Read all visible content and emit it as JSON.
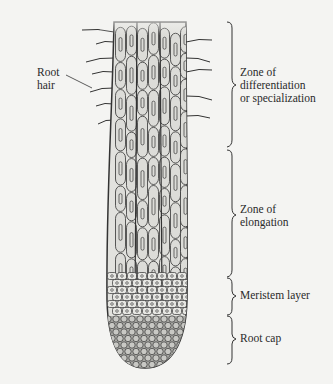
{
  "diagram": {
    "colors": {
      "background": "#f4f4f2",
      "cell_fill": "#dcdcd8",
      "cap_fill": "#a9a9a5",
      "outline": "#333333",
      "text": "#2a2a2a"
    },
    "labels": {
      "root_hair_line1": "Root",
      "root_hair_line2": "hair",
      "differentiation_line1": "Zone of",
      "differentiation_line2": "differentiation",
      "differentiation_line3": "or specialization",
      "elongation_line1": "Zone of",
      "elongation_line2": "elongation",
      "meristem": "Meristem layer",
      "root_cap": "Root cap"
    },
    "zones": [
      {
        "name": "Zone of differentiation or specialization",
        "order": 1
      },
      {
        "name": "Zone of elongation",
        "order": 2
      },
      {
        "name": "Meristem layer",
        "order": 3
      },
      {
        "name": "Root cap",
        "order": 4
      }
    ]
  }
}
